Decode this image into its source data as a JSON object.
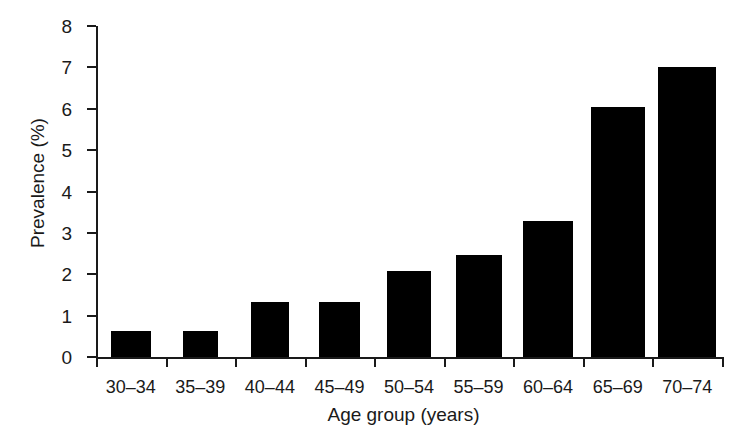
{
  "chart_data": {
    "type": "bar",
    "title": "",
    "subtitle": "",
    "xlabel": "Age group (years)",
    "ylabel": "Prevalence (%)",
    "categories": [
      "30–34",
      "35–39",
      "40–44",
      "45–49",
      "50–54",
      "55–59",
      "60–64",
      "65–69",
      "70–74"
    ],
    "values": [
      0.63,
      0.63,
      1.33,
      1.33,
      2.08,
      2.46,
      3.28,
      6.04,
      7.02
    ],
    "ylim": [
      0,
      8
    ],
    "yticks": [
      0,
      1,
      2,
      3,
      4,
      5,
      6,
      7,
      8
    ],
    "yticklabels": [
      "0",
      "1",
      "2",
      "3",
      "4",
      "5",
      "6",
      "7",
      "8"
    ],
    "grid": false,
    "legend": null,
    "bar_color": "#000000",
    "axis_color": "#1a1a1a",
    "background": "#ffffff",
    "bar_widths_px": [
      40,
      35,
      38,
      41,
      44,
      46,
      50,
      54,
      58
    ]
  }
}
